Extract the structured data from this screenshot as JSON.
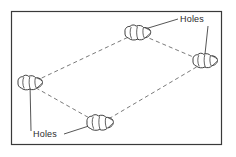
{
  "figure": {
    "background_color": "#ffffff",
    "frame": {
      "name": "figure-border",
      "x": 11,
      "y": 11,
      "width": 211,
      "height": 134,
      "stroke_color": "#3a3a3a",
      "stroke_width": 1.2,
      "fill_color": "#ffffff"
    },
    "labels": [
      {
        "id": "holes-top-right",
        "text": "Holes",
        "x": 180,
        "y": 22,
        "color": "#2b2b2b",
        "font_size": 9
      },
      {
        "id": "holes-bottom-left",
        "text": "Holes",
        "x": 33,
        "y": 137,
        "color": "#2b2b2b",
        "font_size": 9
      }
    ],
    "leader_lines": [
      {
        "id": "leader-top-right-to-top-hole",
        "from": [
          178,
          19
        ],
        "to": [
          143,
          30
        ],
        "color": "#2b2b2b",
        "width": 0.8
      },
      {
        "id": "leader-top-right-to-right-hole",
        "from": [
          208,
          25
        ],
        "to": [
          205,
          54
        ],
        "color": "#2b2b2b",
        "width": 0.8
      },
      {
        "id": "leader-bottom-left-to-bottom-hole",
        "from": [
          64,
          134
        ],
        "to": [
          96,
          123
        ],
        "color": "#2b2b2b",
        "width": 0.8
      },
      {
        "id": "leader-bottom-left-to-left-hole",
        "from": [
          31,
          131
        ],
        "to": [
          30,
          82
        ],
        "color": "#2b2b2b",
        "width": 0.8
      }
    ],
    "quadrilateral": {
      "name": "hole-perimeter-path",
      "stroke_color": "#6b6b6b",
      "stroke_width": 0.9,
      "dash_pattern": "4 3",
      "vertices": [
        {
          "id": "vertex-top",
          "x": 137,
          "y": 33
        },
        {
          "id": "vertex-right",
          "x": 205,
          "y": 62
        },
        {
          "id": "vertex-bottom",
          "x": 100,
          "y": 124
        },
        {
          "id": "vertex-left",
          "x": 29,
          "y": 84
        }
      ],
      "edges": [
        {
          "id": "edge-top-left",
          "from": "vertex-left",
          "to": "vertex-top"
        },
        {
          "id": "edge-top-right",
          "from": "vertex-top",
          "to": "vertex-right"
        },
        {
          "id": "edge-bottom-right",
          "from": "vertex-right",
          "to": "vertex-bottom"
        },
        {
          "id": "edge-bottom-left",
          "from": "vertex-bottom",
          "to": "vertex-left"
        }
      ]
    },
    "holes": [
      {
        "id": "hole-top",
        "name": "hole-shape-top",
        "cx": 137,
        "cy": 33,
        "rx": 14,
        "ry": 7.5,
        "stroke_color": "#1e1e1e",
        "fill_color": "#ffffff"
      },
      {
        "id": "hole-right",
        "name": "hole-shape-right",
        "cx": 205,
        "cy": 61,
        "rx": 13,
        "ry": 7.5,
        "stroke_color": "#1e1e1e",
        "fill_color": "#ffffff"
      },
      {
        "id": "hole-bottom",
        "name": "hole-shape-bottom",
        "cx": 100,
        "cy": 123,
        "rx": 14,
        "ry": 8,
        "stroke_color": "#1e1e1e",
        "fill_color": "#ffffff"
      },
      {
        "id": "hole-left",
        "name": "hole-shape-left",
        "cx": 30,
        "cy": 83,
        "rx": 13,
        "ry": 7.5,
        "stroke_color": "#1e1e1e",
        "fill_color": "#ffffff"
      }
    ]
  }
}
